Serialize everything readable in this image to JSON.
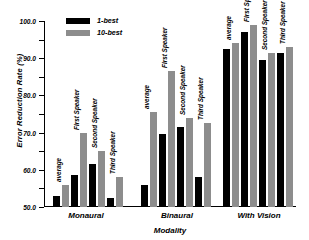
{
  "chart_data": {
    "type": "bar",
    "title": "",
    "xlabel": "Modality",
    "ylabel": "Error Reduction Rate (%)",
    "ylim": [
      0,
      100
    ],
    "ytick_labels": [
      "0.0",
      "10.0",
      "20.0",
      "30.0",
      "40.0",
      "50.0",
      "60.0",
      "70.0",
      "80.0",
      "90.0",
      "100.0"
    ],
    "ytick_values": [
      0,
      10,
      20,
      30,
      40,
      50,
      60,
      70,
      80,
      90,
      100
    ],
    "grid": false,
    "legend_position": "top-center",
    "categories": [
      "Monaural",
      "Binaural",
      "With Vision"
    ],
    "subcategories": [
      "average",
      "First Speaker",
      "Second Speaker",
      "Third Speaker"
    ],
    "series": [
      {
        "name": "1-best",
        "color": "#000000",
        "values": [
          [
            6,
            17,
            23,
            5
          ],
          [
            12,
            39,
            43,
            16
          ],
          [
            85,
            94,
            79,
            83
          ]
        ]
      },
      {
        "name": "10-best",
        "color": "#8d8d8d",
        "values": [
          [
            12,
            40,
            30,
            16
          ],
          [
            51,
            73,
            48,
            45
          ],
          [
            88,
            98,
            83,
            86
          ]
        ]
      }
    ]
  },
  "legend": {
    "items": [
      {
        "label": "1-best",
        "swatch": "one"
      },
      {
        "label": "10-best",
        "swatch": "ten"
      }
    ]
  }
}
